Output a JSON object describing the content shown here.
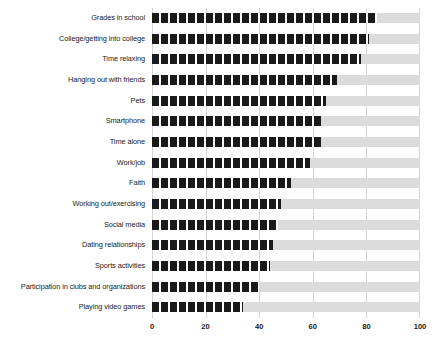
{
  "chart_data": {
    "type": "bar",
    "orientation": "horizontal",
    "title": "",
    "xlabel": "",
    "ylabel": "",
    "xlim": [
      0,
      100
    ],
    "xticks": [
      0,
      20,
      40,
      60,
      80,
      100
    ],
    "grid": true,
    "legend": false,
    "series_color": "#1a1a1a",
    "track_color": "#dcdcdc",
    "categories": [
      "Grades in school",
      "College/getting into college",
      "Time relaxing",
      "Hanging out with friends",
      "Pets",
      "Smartphone",
      "Time alone",
      "Work/job",
      "Faith",
      "Working out/exercising",
      "Social media",
      "Dating relationships",
      "Sports activities",
      "Participation in clubs and organizations",
      "Playing video games"
    ],
    "values": [
      84,
      81,
      78,
      69,
      65,
      63,
      63,
      59,
      52,
      48,
      47,
      45,
      44,
      40,
      34
    ]
  }
}
